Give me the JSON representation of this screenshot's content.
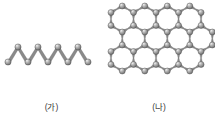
{
  "figure": {
    "background_color": "#ffffff",
    "atom_color": "#8c8c8c",
    "atom_highlight_color": "#e8e8e8",
    "atom_edge_color": "#4a4a4a",
    "bond_color": "#7d7d7d",
    "caption_color": "#3b3b3b"
  },
  "panels": [
    {
      "id": "panel-a",
      "caption": "(가)",
      "structure_name": "zigzag-chain",
      "description": "1차원 지그재그 사슬 구조",
      "atom_count": 9,
      "peak_count": 4,
      "valley_count": 5,
      "bond_count": 8
    },
    {
      "id": "panel-b",
      "caption": "(나)",
      "structure_name": "honeycomb-lattice",
      "description": "2차원 육각형 벌집 구조",
      "hexagon_columns": 4,
      "hexagon_rows": 3
    }
  ],
  "chart_data": {
    "type": "diagram",
    "title": "",
    "subtitle": "",
    "xlabel": "",
    "ylabel": "",
    "legend": [],
    "annotations": [
      "(가)",
      "(나)"
    ],
    "series": [
      {
        "name": "(가) zigzag chain",
        "layout": "1D zigzag",
        "nodes": [
          {
            "x": 8,
            "y": 62
          },
          {
            "x": 18,
            "y": 47
          },
          {
            "x": 28,
            "y": 62
          },
          {
            "x": 38,
            "y": 47
          },
          {
            "x": 48,
            "y": 62
          },
          {
            "x": 58,
            "y": 47
          },
          {
            "x": 68,
            "y": 62
          },
          {
            "x": 78,
            "y": 47
          },
          {
            "x": 88,
            "y": 62
          }
        ],
        "edges": [
          [
            0,
            1
          ],
          [
            1,
            2
          ],
          [
            2,
            3
          ],
          [
            3,
            4
          ],
          [
            4,
            5
          ],
          [
            5,
            6
          ],
          [
            6,
            7
          ],
          [
            7,
            8
          ]
        ]
      },
      {
        "name": "(나) honeycomb lattice",
        "layout": "2D hexagonal",
        "hex_radius": 13,
        "origin": {
          "x": 127,
          "y": 20
        },
        "columns": 4,
        "rows": 3
      }
    ]
  }
}
